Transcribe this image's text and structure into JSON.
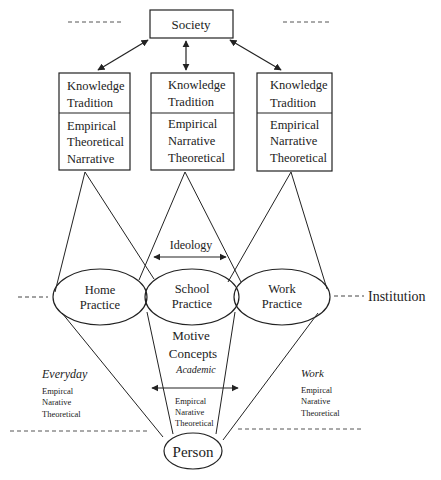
{
  "society": {
    "label": "Society"
  },
  "knowledge_boxes": [
    {
      "title1": "Knowledge",
      "title2": "Tradition",
      "items": [
        "Empirical",
        "Theoretical",
        "Narrative"
      ]
    },
    {
      "title1": "Knowledge",
      "title2": "Tradition",
      "items": [
        "Empirical",
        "Narrative",
        "Theoretical"
      ]
    },
    {
      "title1": "Knowledge",
      "title2": "Tradition",
      "items": [
        "Empirical",
        "Narrative",
        "Theoretical"
      ]
    }
  ],
  "ideology": {
    "label": "Ideology"
  },
  "practices": [
    {
      "line1": "Home",
      "line2": "Practice"
    },
    {
      "line1": "School",
      "line2": "Practice"
    },
    {
      "line1": "Work",
      "line2": "Practice"
    }
  ],
  "institution": {
    "label": "Institution"
  },
  "motive": {
    "line1": "Motive",
    "line2": "Concepts"
  },
  "academic": {
    "label": "Academic",
    "items": [
      "Empircal",
      "Narative",
      "Theoretical"
    ]
  },
  "everyday": {
    "label": "Everyday",
    "items": [
      "Empircal",
      "Narative",
      "Theoretical"
    ]
  },
  "work": {
    "label": "Work",
    "items": [
      "Empircal",
      "Narative",
      "Theoretical"
    ]
  },
  "person": {
    "label": "Person"
  },
  "colors": {
    "stroke": "#222222",
    "background": "#ffffff"
  }
}
